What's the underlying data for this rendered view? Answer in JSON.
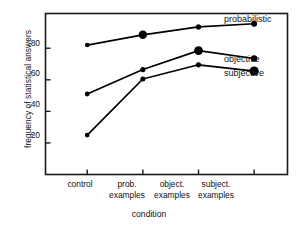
{
  "chart_data": {
    "type": "line",
    "title": "",
    "subtitle": "",
    "xlabel": "condition",
    "ylabel": "frequency of statistical answers",
    "categories": [
      "control",
      "prob. examples",
      "object. examples",
      "subject. examples"
    ],
    "category_lines": [
      [
        "control",
        ""
      ],
      [
        "prob.",
        "examples"
      ],
      [
        "object.",
        "examples"
      ],
      [
        "subject.",
        "examples"
      ]
    ],
    "x": [
      1,
      2,
      3,
      4
    ],
    "xlim": [
      0.25,
      4.6
    ],
    "ylim": [
      0.0,
      1.02
    ],
    "yticks": [
      0.2,
      0.4,
      0.6,
      0.8
    ],
    "ytick_labels": [
      ".20",
      ".40",
      ".60",
      ".80"
    ],
    "grid": false,
    "legend_position": "right-inline",
    "series": [
      {
        "name": "probabilistic",
        "values": [
          0.82,
          0.885,
          0.935,
          0.955
        ],
        "color": "#000000",
        "marker": "circle"
      },
      {
        "name": "objective",
        "values": [
          0.51,
          0.665,
          0.785,
          0.735
        ],
        "color": "#000000",
        "marker": "circle"
      },
      {
        "name": "subjective",
        "values": [
          0.25,
          0.605,
          0.695,
          0.655
        ],
        "color": "#000000",
        "marker": "circle"
      }
    ]
  },
  "axis": {
    "y_tick_0": ".20",
    "y_tick_1": ".40",
    "y_tick_2": ".60",
    "y_tick_3": ".80",
    "x_cat_0_line0": "control",
    "x_cat_0_line1": "",
    "x_cat_1_line0": "prob.",
    "x_cat_1_line1": "examples",
    "x_cat_2_line0": "object.",
    "x_cat_2_line1": "examples",
    "x_cat_3_line0": "subject.",
    "x_cat_3_line1": "examples",
    "y_title": "frequency of statistical answers",
    "x_title": "condition"
  },
  "legend": {
    "probabilistic": "probabilistic",
    "objective": "objective",
    "subjective": "subjective"
  },
  "style": {
    "frame_color": "#1a1a1a",
    "line_color": "#000000",
    "plot_background": "#ffffff",
    "page_background": "#ffffff"
  }
}
